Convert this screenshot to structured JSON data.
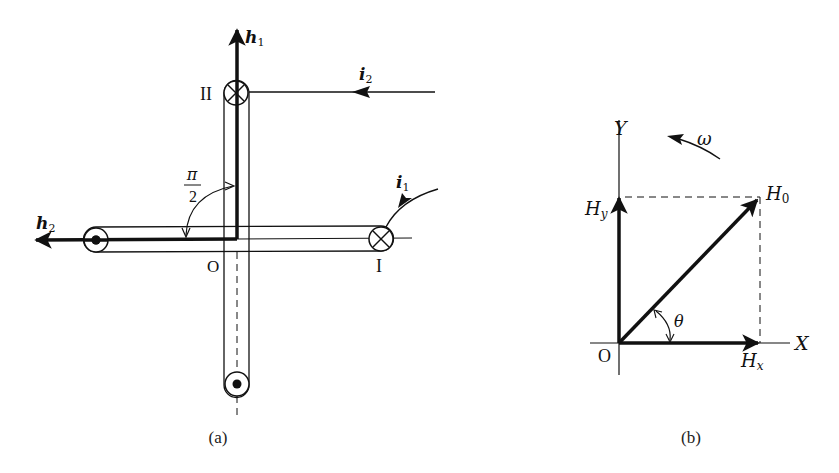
{
  "figure_a": {
    "caption": "(a)",
    "vectors": {
      "h1": {
        "base": "h",
        "sub": "1"
      },
      "h2": {
        "base": "h",
        "sub": "2"
      }
    },
    "currents": {
      "i1": {
        "base": "i",
        "sub": "1"
      },
      "i2": {
        "base": "i",
        "sub": "2"
      }
    },
    "coils": {
      "coil_1": {
        "label": "I"
      },
      "coil_2": {
        "label": "II"
      }
    },
    "origin_label": "O",
    "angle": {
      "numerator": "π",
      "denominator": "2"
    }
  },
  "figure_b": {
    "caption": "(b)",
    "axes": {
      "x": "X",
      "y": "Y",
      "origin": "O"
    },
    "vectors": {
      "H0": {
        "base": "H",
        "sub": "0"
      },
      "Hx": {
        "base": "H",
        "sub": "x"
      },
      "Hy": {
        "base": "H",
        "sub": "y"
      }
    },
    "rotation": "ω",
    "angle": "θ"
  },
  "colors": {
    "ink": "#111111",
    "background": "#ffffff"
  }
}
